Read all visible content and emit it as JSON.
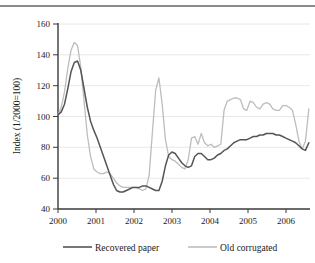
{
  "figure": {
    "top_rule": "horizontal-rule"
  },
  "chart_data": {
    "type": "line",
    "title": "",
    "xlabel": "",
    "ylabel": "Index (1/2000=100)",
    "xlim": [
      2000.0,
      2006.45
    ],
    "ylim": [
      40,
      160
    ],
    "yticks": [
      40,
      60,
      80,
      100,
      120,
      140,
      160
    ],
    "xticks": [
      2000,
      2001,
      2002,
      2003,
      2004,
      2005,
      2006
    ],
    "xtick_labels": [
      "2000",
      "2001",
      "2002",
      "2003",
      "2004",
      "2005",
      "2006"
    ],
    "ytick_labels": [
      "40",
      "60",
      "80",
      "100",
      "120",
      "140",
      "160"
    ],
    "grid": "horizontal",
    "legend_position": "bottom",
    "colors": {
      "recovered_paper": "#555555",
      "old_corrugated": "#bdbdbd",
      "gridline": "#e2e2e2",
      "axis": "#3a3a3a"
    },
    "x": [
      2000.0,
      2000.083,
      2000.167,
      2000.25,
      2000.333,
      2000.417,
      2000.5,
      2000.583,
      2000.667,
      2000.75,
      2000.833,
      2000.917,
      2001.0,
      2001.083,
      2001.167,
      2001.25,
      2001.333,
      2001.417,
      2001.5,
      2001.583,
      2001.667,
      2001.75,
      2001.833,
      2001.917,
      2002.0,
      2002.083,
      2002.167,
      2002.25,
      2002.333,
      2002.417,
      2002.5,
      2002.583,
      2002.667,
      2002.75,
      2002.833,
      2002.917,
      2003.0,
      2003.083,
      2003.167,
      2003.25,
      2003.333,
      2003.417,
      2003.5,
      2003.583,
      2003.667,
      2003.75,
      2003.833,
      2003.917,
      2004.0,
      2004.083,
      2004.167,
      2004.25,
      2004.333,
      2004.417,
      2004.5,
      2004.583,
      2004.667,
      2004.75,
      2004.833,
      2004.917,
      2005.0,
      2005.083,
      2005.167,
      2005.25,
      2005.333,
      2005.417,
      2005.5,
      2005.583,
      2005.667,
      2005.75,
      2005.833,
      2005.917,
      2006.0,
      2006.083,
      2006.167,
      2006.25,
      2006.333,
      2006.42
    ],
    "series": [
      {
        "name": "Recovered paper",
        "color": "#555555",
        "values": [
          101,
          103,
          108,
          118,
          129,
          135,
          136,
          130,
          118,
          106,
          97,
          91,
          86,
          80,
          74,
          68,
          62,
          56,
          52,
          51,
          51,
          52,
          53,
          54,
          54,
          54,
          55,
          55,
          54,
          53,
          52,
          52,
          58,
          68,
          75,
          77,
          76,
          73,
          70,
          68,
          67,
          68,
          74,
          76,
          76,
          74,
          72,
          72,
          73,
          75,
          76,
          78,
          79,
          81,
          83,
          84,
          85,
          85,
          85,
          86,
          87,
          87,
          88,
          88,
          89,
          89,
          89,
          88,
          88,
          87,
          86,
          85,
          84,
          83,
          81,
          79,
          78,
          83
        ]
      },
      {
        "name": "Old corrugated",
        "color": "#bdbdbd",
        "values": [
          101,
          106,
          116,
          131,
          143,
          148,
          146,
          132,
          110,
          88,
          74,
          66,
          64,
          63,
          63,
          64,
          63,
          60,
          57,
          55,
          54,
          54,
          54,
          54,
          54,
          53,
          52,
          53,
          62,
          90,
          117,
          125,
          108,
          85,
          74,
          72,
          71,
          69,
          67,
          66,
          72,
          86,
          87,
          82,
          89,
          83,
          81,
          82,
          80,
          81,
          82,
          104,
          110,
          111,
          112,
          112,
          111,
          105,
          104,
          110,
          109,
          106,
          105,
          108,
          109,
          108,
          105,
          104,
          104,
          107,
          107,
          106,
          104,
          95,
          84,
          79,
          84,
          105
        ]
      }
    ],
    "annotations": []
  },
  "legend": {
    "entries": [
      {
        "label": "Recovered paper",
        "swatch": "line-swatch-dark"
      },
      {
        "label": "Old corrugated",
        "swatch": "line-swatch-light"
      }
    ]
  }
}
